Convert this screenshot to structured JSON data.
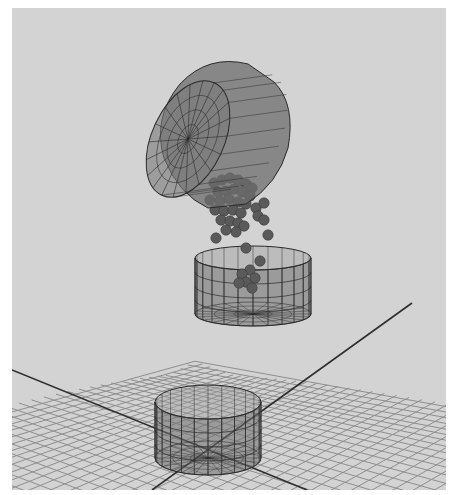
{
  "viewport": {
    "background": "#d3d3d3",
    "border_color": "#ffffff",
    "grid_color": "#8e8e8e",
    "axis_color": "#2e2e2e",
    "wire_color": "#2a2a2a",
    "mesh_fill": "#6e6e6e",
    "mesh_fill_opacity": 0.55,
    "particle_color": "#5a5a5a"
  },
  "scene": {
    "objects": [
      {
        "name": "pouring-cylinder",
        "type": "tilted-cylinder",
        "state": "pouring"
      },
      {
        "name": "upper-container",
        "type": "open-cylinder",
        "state": "receiving particles"
      },
      {
        "name": "lower-container",
        "type": "open-cylinder",
        "state": "empty"
      },
      {
        "name": "particle-stream",
        "type": "particles",
        "count": 40
      },
      {
        "name": "ground-grid",
        "type": "grid"
      }
    ]
  }
}
